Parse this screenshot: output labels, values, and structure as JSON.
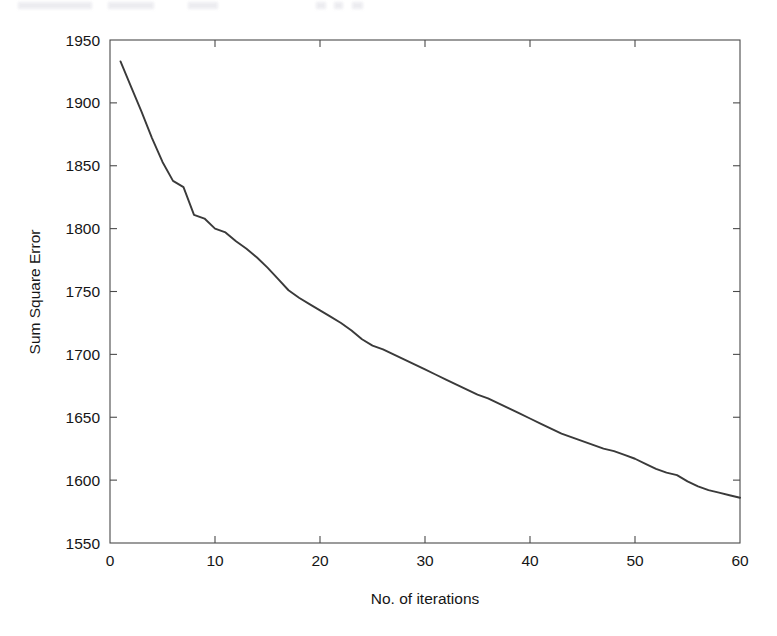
{
  "figure": {
    "background_color": "#ffffff",
    "axis_color": "#4a4a4a",
    "line_color": "#3a3a3a",
    "scan_artifact": true
  },
  "chart_data": {
    "type": "line",
    "title": "",
    "xlabel": "No. of iterations",
    "ylabel": "Sum Square Error",
    "xlim": [
      0,
      60
    ],
    "ylim": [
      1550,
      1950
    ],
    "xticks": [
      0,
      10,
      20,
      30,
      40,
      50,
      60
    ],
    "yticks": [
      1550,
      1600,
      1650,
      1700,
      1750,
      1800,
      1850,
      1900,
      1950
    ],
    "xticklabels": [
      "0",
      "10",
      "20",
      "30",
      "40",
      "50",
      "60"
    ],
    "yticklabels": [
      "1550",
      "1600",
      "1650",
      "1700",
      "1750",
      "1800",
      "1850",
      "1900",
      "1950"
    ],
    "grid": false,
    "legend": null,
    "box": true,
    "minor_ticks_right": true,
    "series": [
      {
        "name": "Sum Square Error",
        "color": "#3a3a3a",
        "x": [
          1,
          2,
          3,
          4,
          5,
          6,
          7,
          8,
          9,
          10,
          11,
          12,
          13,
          14,
          15,
          16,
          17,
          18,
          19,
          20,
          21,
          22,
          23,
          24,
          25,
          26,
          27,
          28,
          29,
          30,
          31,
          32,
          33,
          34,
          35,
          36,
          37,
          38,
          39,
          40,
          41,
          42,
          43,
          44,
          45,
          46,
          47,
          48,
          49,
          50,
          51,
          52,
          53,
          54,
          55,
          56,
          57,
          58,
          59,
          60
        ],
        "values": [
          1933,
          1913,
          1893,
          1872,
          1853,
          1838,
          1833,
          1811,
          1808,
          1800,
          1797,
          1790,
          1784,
          1777,
          1769,
          1760,
          1751,
          1745,
          1740,
          1735,
          1730,
          1725,
          1719,
          1712,
          1707,
          1704,
          1700,
          1696,
          1692,
          1688,
          1684,
          1680,
          1676,
          1672,
          1668,
          1665,
          1661,
          1657,
          1653,
          1649,
          1645,
          1641,
          1637,
          1634,
          1631,
          1628,
          1625,
          1623,
          1620,
          1617,
          1613,
          1609,
          1606,
          1604,
          1599,
          1595,
          1592,
          1590,
          1588,
          1586
        ]
      }
    ]
  }
}
